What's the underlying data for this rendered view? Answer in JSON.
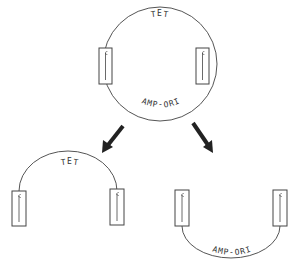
{
  "diagram": {
    "top_plasmid": {
      "top_label": "TET",
      "bottom_label": "AMP-ORI"
    },
    "bottom_left_fragment": {
      "label": "TET"
    },
    "bottom_right_fragment": {
      "label": "AMP-ORI"
    }
  }
}
